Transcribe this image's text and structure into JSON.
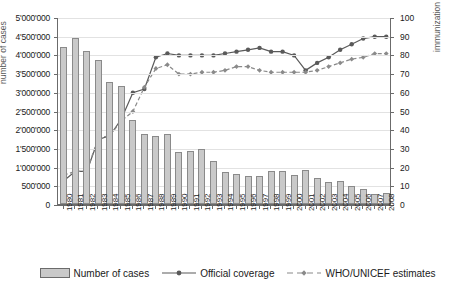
{
  "chart_data": {
    "type": "bar",
    "title": "",
    "subtitle": "",
    "xlabel": "",
    "ylabel": "number of cases",
    "y2label": "immunization coverage (%)",
    "ylim": [
      0,
      5000000
    ],
    "y2lim": [
      0,
      100
    ],
    "grid": true,
    "legend_position": "bottom",
    "categories": [
      "1980",
      "1981",
      "1982",
      "1983",
      "1984",
      "1985",
      "1986",
      "1987",
      "1988",
      "1989",
      "1990",
      "1991",
      "1992",
      "1993",
      "1994",
      "1995",
      "1996",
      "1997",
      "1998",
      "1999",
      "2000",
      "2001",
      "2002",
      "2003",
      "2004",
      "2005",
      "2006",
      "2007",
      "2008"
    ],
    "ytick_labels": [
      "0",
      "500'000",
      "1'000'000",
      "1'500'000",
      "2'000'000",
      "2'500'000",
      "3'000'000",
      "3'500'000",
      "4'000'000",
      "4'500'000",
      "5'000'000"
    ],
    "ytick_values": [
      0,
      500000,
      1000000,
      1500000,
      2000000,
      2500000,
      3000000,
      3500000,
      4000000,
      4500000,
      5000000
    ],
    "y2tick_labels": [
      "0",
      "10",
      "20",
      "30",
      "40",
      "50",
      "60",
      "70",
      "80",
      "90",
      "100"
    ],
    "y2tick_values": [
      0,
      10,
      20,
      30,
      40,
      50,
      60,
      70,
      80,
      90,
      100
    ],
    "series": [
      {
        "name": "Number of cases",
        "type": "bar",
        "axis": "left",
        "color": "#c9c9c9",
        "edge_color": "#8a8a8a",
        "values": [
          4200000,
          4450000,
          4100000,
          3850000,
          3250000,
          3150000,
          2250000,
          1880000,
          1830000,
          1880000,
          1380000,
          1410000,
          1470000,
          1140000,
          850000,
          800000,
          760000,
          750000,
          880000,
          870000,
          770000,
          900000,
          690000,
          580000,
          620000,
          480000,
          400000,
          280000,
          300000
        ]
      },
      {
        "name": "Official coverage",
        "type": "line",
        "axis": "right",
        "color": "#5a5a5a",
        "marker": "circle",
        "dash": "solid",
        "values": [
          13,
          18,
          18,
          35,
          37,
          46,
          60,
          62,
          79,
          81,
          80,
          80,
          80,
          80,
          81,
          82,
          83,
          84,
          82,
          82,
          80,
          72,
          76,
          79,
          83,
          86,
          89,
          90,
          90
        ]
      },
      {
        "name": "WHO/UNICEF estimates",
        "type": "line",
        "axis": "right",
        "color": "#8a8a8a",
        "marker": "diamond",
        "dash": "dashed",
        "values": [
          16,
          18,
          18,
          36,
          37,
          45,
          50,
          63,
          73,
          75,
          70,
          70,
          71,
          71,
          72,
          74,
          74,
          72,
          71,
          71,
          71,
          71,
          72,
          74,
          76,
          78,
          79,
          81,
          81
        ]
      }
    ]
  },
  "legend": {
    "items": [
      {
        "label": "Number of cases",
        "glyph": "bar-swatch"
      },
      {
        "label": "Official coverage",
        "glyph": "line-circle-solid"
      },
      {
        "label": "WHO/UNICEF estimates",
        "glyph": "line-diamond-dashed"
      }
    ]
  }
}
